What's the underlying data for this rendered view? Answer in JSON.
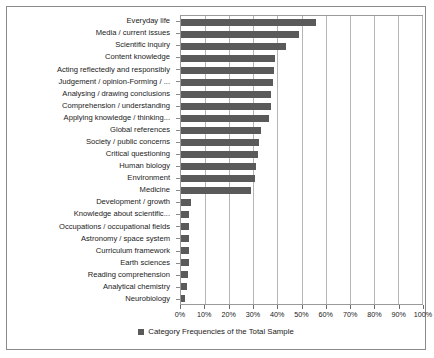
{
  "chart_data": {
    "type": "bar",
    "orientation": "horizontal",
    "title": "",
    "xlabel": "",
    "ylabel": "",
    "xlim": [
      0,
      100
    ],
    "xtick_labels": [
      "0%",
      "10%",
      "20%",
      "30%",
      "40%",
      "50%",
      "60%",
      "70%",
      "80%",
      "90%",
      "100%"
    ],
    "xtick_values": [
      0,
      10,
      20,
      30,
      40,
      50,
      60,
      70,
      80,
      90,
      100
    ],
    "grid": true,
    "legend_position": "bottom",
    "legend": [
      "Category Frequencies of the Total Sample"
    ],
    "series_color": "#5a5a5a",
    "categories": [
      "Everyday life",
      "Media / current issues",
      "Scientific inquiry",
      "Content knowledge",
      "Acting reflectedly and responsibly",
      "Judgement / opinion-Forming / ...",
      "Analysing / drawing conclusions",
      "Comprehension / understanding",
      "Applying knowledge / thinking...",
      "Global references",
      "Society / public concerns",
      "Critical questioning",
      "Human biology",
      "Environment",
      "Medicine",
      "Development / growth",
      "Knowledge about scientific...",
      "Occupations / occupational fields",
      "Astronomy / space system",
      "Curriculum framework",
      "Earth sciences",
      "Reading comprehension",
      "Analytical chemistry",
      "Neurobiology"
    ],
    "values": [
      56,
      49,
      43.5,
      39,
      38.5,
      38,
      37.5,
      37.5,
      36.5,
      33,
      32.5,
      32,
      31,
      30.5,
      29,
      4,
      3.5,
      3.5,
      3.5,
      3.5,
      3.5,
      3,
      2.5,
      1.5
    ],
    "series": [
      {
        "name": "Category Frequencies of the Total Sample",
        "values": [
          56,
          49,
          43.5,
          39,
          38.5,
          38,
          37.5,
          37.5,
          36.5,
          33,
          32.5,
          32,
          31,
          30.5,
          29,
          4,
          3.5,
          3.5,
          3.5,
          3.5,
          3.5,
          3,
          2.5,
          1.5
        ]
      }
    ]
  }
}
